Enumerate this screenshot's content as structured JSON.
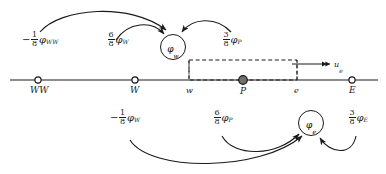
{
  "figure": {
    "type": "finite-volume-stencil-diagram",
    "line_color": "#1a1a1a",
    "background": "#ffffff",
    "node_fill": "#ffffff",
    "cell_center_fill": "#707070"
  },
  "axis": {
    "name": "x-axis-line",
    "nodes": [
      {
        "id": "WW",
        "label": "WW",
        "marker": "open-circle",
        "x": 38
      },
      {
        "id": "W",
        "label": "W",
        "marker": "open-circle",
        "x": 135
      },
      {
        "id": "P",
        "label": "P",
        "marker": "filled-circle",
        "x": 243
      },
      {
        "id": "E",
        "label": "E",
        "marker": "open-circle",
        "x": 352
      }
    ],
    "faces": [
      {
        "id": "w",
        "label": "w",
        "x": 189
      },
      {
        "id": "e",
        "label": "e",
        "x": 297
      }
    ]
  },
  "control_volume": {
    "name": "dashed-control-volume",
    "style": "dashed",
    "left_face": "w",
    "right_face": "e"
  },
  "velocity": {
    "name": "velocity-arrow",
    "label": "u",
    "subscript": "e",
    "direction": "right"
  },
  "face_values": [
    {
      "id": "phi_w",
      "label": "φ",
      "subscript": "w",
      "position": "top",
      "description": "circled west face value"
    },
    {
      "id": "phi_e",
      "label": "φ",
      "subscript": "e",
      "position": "bottom",
      "description": "circled east face value"
    }
  ],
  "coefficients": {
    "top": [
      {
        "id": "coef-phi-ww",
        "sign": "−",
        "numerator": "1",
        "denominator": "8",
        "phi": "φ",
        "subscript": "WW",
        "target": "phi_w"
      },
      {
        "id": "coef-phi-w-upper",
        "sign": "",
        "numerator": "6",
        "denominator": "8",
        "phi": "φ",
        "subscript": "W",
        "target": "phi_w"
      },
      {
        "id": "coef-phi-p-upper",
        "sign": "",
        "numerator": "3",
        "denominator": "8",
        "phi": "φ",
        "subscript": "P",
        "target": "phi_w"
      }
    ],
    "bottom": [
      {
        "id": "coef-phi-w-lower",
        "sign": "−",
        "numerator": "1",
        "denominator": "8",
        "phi": "φ",
        "subscript": "W",
        "target": "phi_e"
      },
      {
        "id": "coef-phi-p-lower",
        "sign": "",
        "numerator": "6",
        "denominator": "8",
        "phi": "φ",
        "subscript": "P",
        "target": "phi_e"
      },
      {
        "id": "coef-phi-e-lower",
        "sign": "",
        "numerator": "3",
        "denominator": "8",
        "phi": "φ",
        "subscript": "E",
        "target": "phi_e"
      }
    ]
  }
}
